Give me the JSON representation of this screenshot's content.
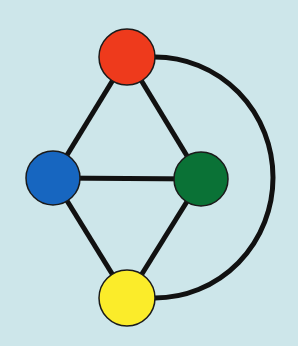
{
  "diagram": {
    "type": "graph",
    "background": "#cde6ea",
    "edge_color": "#111111",
    "edge_width": 5,
    "nodes": [
      {
        "id": "red",
        "color": "#ee3a1c",
        "cx": 127,
        "cy": 57,
        "r": 28
      },
      {
        "id": "blue",
        "color": "#1766c0",
        "cx": 53,
        "cy": 178,
        "r": 27
      },
      {
        "id": "green",
        "color": "#0a7236",
        "cx": 201,
        "cy": 179,
        "r": 27
      },
      {
        "id": "yellow",
        "color": "#fbec2a",
        "cx": 127,
        "cy": 298,
        "r": 28
      }
    ],
    "edges": [
      {
        "from": "red",
        "to": "blue",
        "curved": false
      },
      {
        "from": "red",
        "to": "green",
        "curved": false
      },
      {
        "from": "blue",
        "to": "green",
        "curved": false
      },
      {
        "from": "blue",
        "to": "yellow",
        "curved": false
      },
      {
        "from": "green",
        "to": "yellow",
        "curved": false
      },
      {
        "from": "red",
        "to": "yellow",
        "curved": true
      }
    ]
  }
}
